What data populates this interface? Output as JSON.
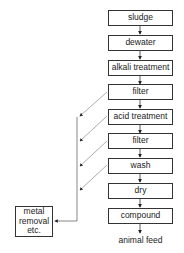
{
  "diagram": {
    "type": "flowchart",
    "main_steps": [
      {
        "id": "sludge",
        "label": "sludge"
      },
      {
        "id": "dewater",
        "label": "dewater"
      },
      {
        "id": "alkali",
        "label": "alkali treatment"
      },
      {
        "id": "filter1",
        "label": "filter"
      },
      {
        "id": "acid",
        "label": "acid treatment"
      },
      {
        "id": "filter2",
        "label": "filter"
      },
      {
        "id": "wash",
        "label": "wash"
      },
      {
        "id": "dry",
        "label": "dry"
      },
      {
        "id": "compound",
        "label": "compound"
      }
    ],
    "output": {
      "label": "animal feed"
    },
    "side_box": {
      "line1": "metal",
      "line2": "removal",
      "line3": "etc."
    },
    "side_branches_from": [
      "filter1",
      "acid",
      "filter2",
      "wash"
    ],
    "colors": {
      "line": "#333333",
      "box_border": "#333333",
      "background": "#ffffff",
      "branch_line": "#888888"
    }
  }
}
